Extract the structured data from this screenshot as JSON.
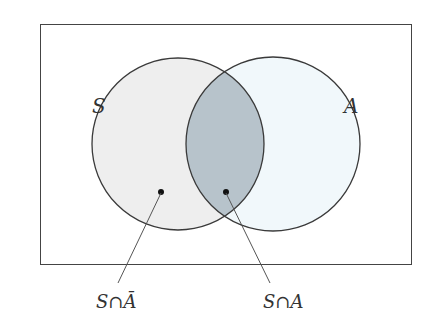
{
  "diagram": {
    "type": "venn",
    "universe": {
      "x": 40,
      "y": 24,
      "width": 372,
      "height": 241,
      "stroke": "#333333"
    },
    "sets": [
      {
        "name": "S",
        "label": "S",
        "cx": 178,
        "cy": 144,
        "r": 86,
        "fill": "#eeeeee"
      },
      {
        "name": "A",
        "label": "A",
        "cx": 273,
        "cy": 144,
        "r": 87,
        "fill": "#f1f8fb"
      }
    ],
    "intersection_fill": "#b7c3cb",
    "stroke_color": "#3a3a3a",
    "callouts": [
      {
        "label": "S∩Ā",
        "dot": [
          161,
          193
        ],
        "label_pos": [
          98,
          305
        ]
      },
      {
        "label": "S∩A",
        "dot": [
          226,
          192
        ],
        "label_pos": [
          265,
          305
        ]
      }
    ]
  }
}
